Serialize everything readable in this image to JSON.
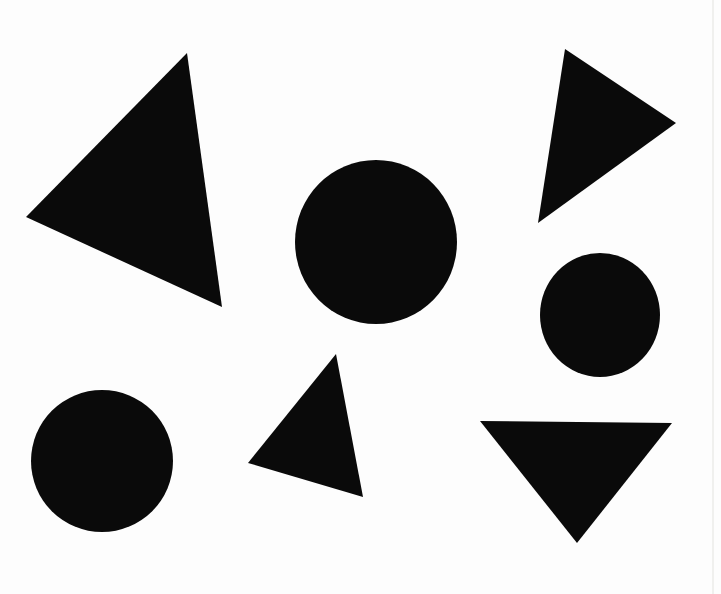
{
  "image": {
    "description": "Seven black hand-cut paper shapes (four triangles, three circles) scattered on a white scanned page",
    "width": 721,
    "height": 594,
    "background_color": "#fdfdfd",
    "shape_color": "#0a0a0a"
  },
  "shapes": [
    {
      "id": "large-left-triangle",
      "type": "triangle",
      "points": [
        [
          187,
          53
        ],
        [
          26,
          217
        ],
        [
          222,
          307
        ]
      ]
    },
    {
      "id": "top-right-triangle",
      "type": "triangle",
      "points": [
        [
          565,
          49
        ],
        [
          676,
          123
        ],
        [
          538,
          223
        ]
      ]
    },
    {
      "id": "center-circle",
      "type": "circle",
      "cx": 376,
      "cy": 242,
      "rx": 81,
      "ry": 82
    },
    {
      "id": "right-circle",
      "type": "circle",
      "cx": 600,
      "cy": 315,
      "rx": 60,
      "ry": 62
    },
    {
      "id": "bottom-left-circle",
      "type": "circle",
      "cx": 102,
      "cy": 461,
      "rx": 71,
      "ry": 71
    },
    {
      "id": "bottom-center-triangle",
      "type": "triangle",
      "points": [
        [
          336,
          354
        ],
        [
          248,
          463
        ],
        [
          363,
          497
        ]
      ]
    },
    {
      "id": "bottom-right-triangle",
      "type": "triangle",
      "points": [
        [
          480,
          421
        ],
        [
          672,
          423
        ],
        [
          577,
          543
        ]
      ]
    }
  ],
  "artifacts": [
    {
      "id": "page-edge-line",
      "type": "vertical-line",
      "x": 712,
      "y1": 0,
      "y2": 594,
      "color": "#f0f0ee",
      "width": 2
    }
  ]
}
